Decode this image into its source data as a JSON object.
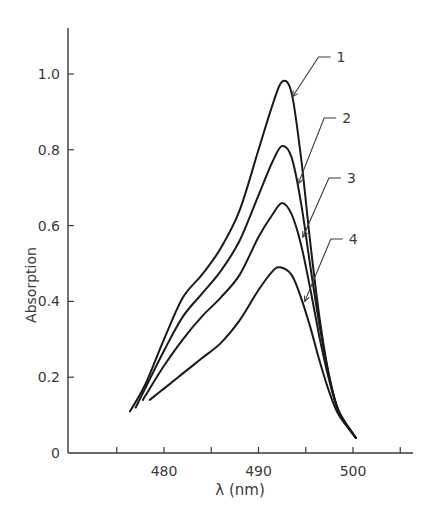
{
  "chart_data": {
    "type": "line",
    "title": "",
    "xlabel": "λ (nm)",
    "ylabel": "Absorption",
    "xlim": [
      470,
      506
    ],
    "ylim": [
      0,
      1.1
    ],
    "x_ticks": [
      475,
      480,
      485,
      490,
      495,
      500,
      505
    ],
    "x_tick_labels": [
      "",
      "480",
      "",
      "490",
      "",
      "500",
      ""
    ],
    "y_ticks": [
      0,
      0.2,
      0.4,
      0.6,
      0.8,
      1.0
    ],
    "y_tick_labels": [
      "0",
      "0.2",
      "0.4",
      "0.6",
      "0.8",
      "1.0"
    ],
    "grid": false,
    "legend": "inline numbered labels with leader arrows pointing to the descending side of each curve",
    "series": [
      {
        "name": "1",
        "peak": {
          "x": 492.5,
          "y": 0.98
        },
        "x": [
          476.4,
          478,
          480,
          482,
          484,
          486,
          488,
          490,
          491.5,
          492.5,
          493.5,
          494.5,
          495.5,
          496.5,
          497.5,
          498.5,
          500.3
        ],
        "y": [
          0.11,
          0.18,
          0.3,
          0.41,
          0.47,
          0.54,
          0.64,
          0.8,
          0.92,
          0.98,
          0.95,
          0.78,
          0.55,
          0.35,
          0.2,
          0.11,
          0.04
        ]
      },
      {
        "name": "2",
        "peak": {
          "x": 492.5,
          "y": 0.81
        },
        "x": [
          477.0,
          478,
          480,
          482,
          484,
          486,
          488,
          490,
          491.5,
          492.5,
          493.5,
          494.5,
          495.5,
          496.5,
          497.5,
          498.5,
          500.3
        ],
        "y": [
          0.12,
          0.17,
          0.27,
          0.36,
          0.42,
          0.48,
          0.56,
          0.68,
          0.77,
          0.81,
          0.78,
          0.66,
          0.49,
          0.33,
          0.2,
          0.11,
          0.04
        ]
      },
      {
        "name": "3",
        "peak": {
          "x": 492.5,
          "y": 0.66
        },
        "x": [
          477.8,
          478,
          480,
          482,
          484,
          486,
          488,
          490,
          491.5,
          492.5,
          493.5,
          494.5,
          495.5,
          496.5,
          497.5,
          498.5,
          500.3
        ],
        "y": [
          0.14,
          0.15,
          0.23,
          0.3,
          0.36,
          0.41,
          0.47,
          0.57,
          0.63,
          0.66,
          0.63,
          0.55,
          0.43,
          0.3,
          0.19,
          0.11,
          0.04
        ]
      },
      {
        "name": "4",
        "peak": {
          "x": 492.3,
          "y": 0.49
        },
        "x": [
          478.5,
          480,
          482,
          484,
          486,
          488,
          490,
          491.5,
          492.3,
          493.5,
          494.5,
          495.5,
          496.5,
          497.5,
          498.5,
          500.3
        ],
        "y": [
          0.14,
          0.17,
          0.21,
          0.25,
          0.29,
          0.35,
          0.43,
          0.48,
          0.49,
          0.47,
          0.41,
          0.33,
          0.24,
          0.16,
          0.1,
          0.04
        ]
      }
    ],
    "annotations": [
      {
        "text": "1",
        "points_to": {
          "x": 493.6,
          "y": 0.94
        }
      },
      {
        "text": "2",
        "points_to": {
          "x": 494.2,
          "y": 0.71
        }
      },
      {
        "text": "3",
        "points_to": {
          "x": 494.7,
          "y": 0.57
        }
      },
      {
        "text": "4",
        "points_to": {
          "x": 494.9,
          "y": 0.4
        }
      }
    ]
  },
  "labels": {
    "ylabel": "Absorption",
    "xlabel": "λ (nm)",
    "y_ticks": [
      "0",
      "0.2",
      "0.4",
      "0.6",
      "0.8",
      "1.0"
    ],
    "x_ticks": [
      "480",
      "490",
      "500"
    ],
    "curve_labels": [
      "1",
      "2",
      "3",
      "4"
    ]
  },
  "style": {
    "line_color": "#1a1a1a",
    "axis_color": "#3a3a3a",
    "background": "#ffffff"
  }
}
